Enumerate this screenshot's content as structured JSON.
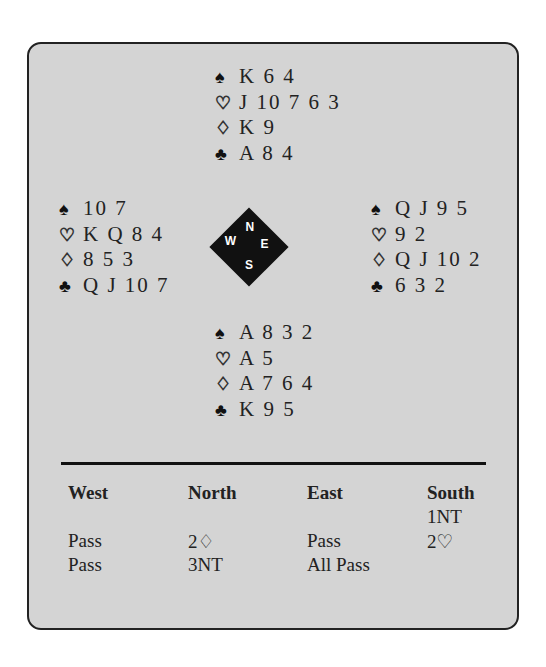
{
  "hands": {
    "north": {
      "spades": "K 6 4",
      "hearts": "J 10 7 6 3",
      "diamonds": "K 9",
      "clubs": "A 8 4"
    },
    "west": {
      "spades": "10 7",
      "hearts": "K Q 8 4",
      "diamonds": "8 5 3",
      "clubs": "Q J 10 7"
    },
    "east": {
      "spades": "Q J 9 5",
      "hearts": "9 2",
      "diamonds": "Q J 10 2",
      "clubs": "6 3 2"
    },
    "south": {
      "spades": "A 8 3 2",
      "hearts": "A 5",
      "diamonds": "A 7 6 4",
      "clubs": "K 9 5"
    }
  },
  "suit_symbols": {
    "spades": "♠",
    "hearts": "♡",
    "diamonds": "♢",
    "clubs": "♣"
  },
  "compass": {
    "n": "N",
    "e": "E",
    "s": "S",
    "w": "W"
  },
  "auction": {
    "headers": [
      "West",
      "North",
      "East",
      "South"
    ],
    "rows": [
      [
        "",
        "",
        "",
        "1NT"
      ],
      [
        "Pass",
        "2♢",
        "Pass",
        "2♡"
      ],
      [
        "Pass",
        "3NT",
        "All Pass",
        ""
      ]
    ]
  }
}
